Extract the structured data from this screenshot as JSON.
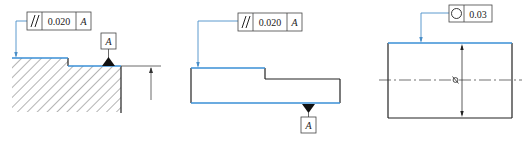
{
  "colors": {
    "outline": "#222222",
    "toleranced_surface": "#3a8fd6",
    "leader": "#4a8fc8",
    "hatch": "#444444",
    "background": "#ffffff"
  },
  "figures": [
    {
      "id": "parallelism-hatched",
      "fcf": {
        "symbol": "parallelism-icon",
        "symbol_text": "//",
        "tolerance": "0.020",
        "datum": "A"
      },
      "datum_label": "A"
    },
    {
      "id": "parallelism-stepped-block",
      "fcf": {
        "symbol": "parallelism-icon",
        "symbol_text": "//",
        "tolerance": "0.020",
        "datum": "A"
      },
      "datum_label": "A"
    },
    {
      "id": "circularity-cylinder",
      "fcf": {
        "symbol": "circularity-icon",
        "tolerance": "0.03"
      },
      "diameter_symbol": "⌀"
    }
  ]
}
